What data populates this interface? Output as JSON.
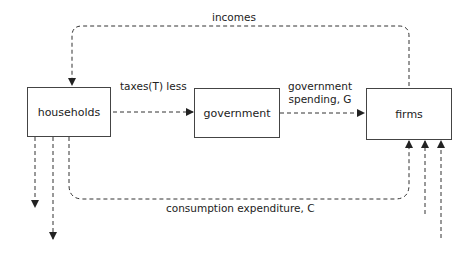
{
  "nodes": {
    "households": "households",
    "government": "government",
    "firms": "firms"
  },
  "flows": {
    "incomes": "incomes",
    "taxes": "taxes(T) less",
    "gov_spending_line1": "government",
    "gov_spending_line2": "spending, G",
    "consumption": "consumption expenditure, C"
  },
  "colors": {
    "line": "#333333",
    "box_border": "#444444",
    "text": "#222222"
  }
}
